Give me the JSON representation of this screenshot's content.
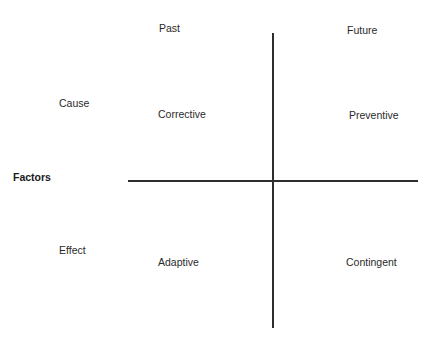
{
  "diagram": {
    "row_header": "Factors",
    "columns": {
      "left": "Past",
      "right": "Future"
    },
    "rows": {
      "top": "Cause",
      "bottom": "Effect"
    },
    "quadrants": {
      "top_left": "Corrective",
      "top_right": "Preventive",
      "bottom_left": "Adaptive",
      "bottom_right": "Contingent"
    }
  }
}
